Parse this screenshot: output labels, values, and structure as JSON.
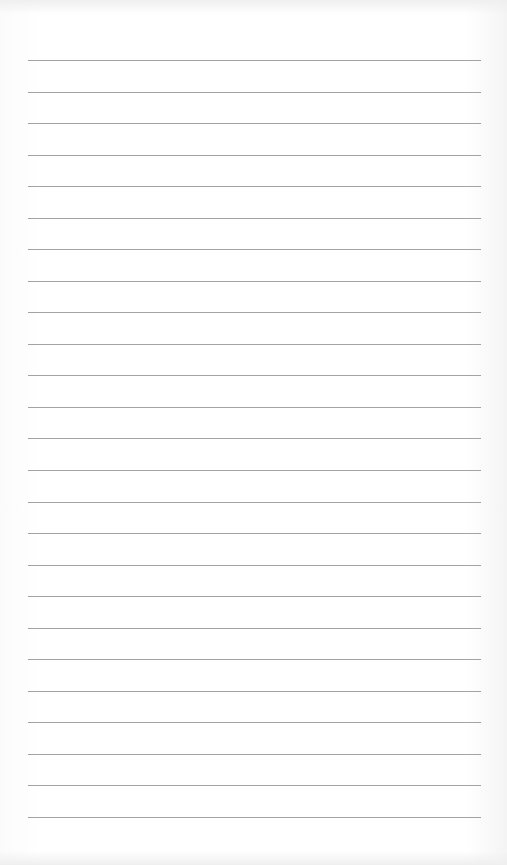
{
  "page": {
    "type": "lined-paper",
    "line_count": 25,
    "first_line_y": 60,
    "line_spacing": 31.54,
    "line_left": 28,
    "line_width": 453,
    "line_color": "#a3a3a3",
    "background_color": "#ffffff",
    "text": []
  }
}
